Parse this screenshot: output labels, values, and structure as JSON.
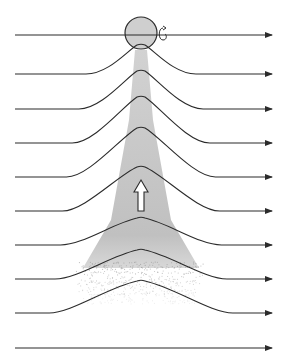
{
  "diagram": {
    "type": "streamline-flow-around-rotating-sphere",
    "colors": {
      "background": "#ffffff",
      "line": "#2b2b2b",
      "wake_fill": "#c4c4c4",
      "wake_speckle": "#9a9a9a",
      "sphere_fill": "#cfcfcf",
      "arrow_fill": "#ffffff"
    },
    "sphere": {
      "cx": 141,
      "cy": 33,
      "r": 16
    },
    "rotation_icon": {
      "x": 162,
      "y": 34
    },
    "streamlines": [
      {
        "baseline_y": 35,
        "peak_y": 35,
        "label": "streamline-0"
      },
      {
        "baseline_y": 74,
        "peak_y": 45,
        "label": "streamline-1"
      },
      {
        "baseline_y": 109,
        "peak_y": 71,
        "label": "streamline-2"
      },
      {
        "baseline_y": 143,
        "peak_y": 97,
        "label": "streamline-3"
      },
      {
        "baseline_y": 177,
        "peak_y": 128,
        "label": "streamline-4"
      },
      {
        "baseline_y": 211,
        "peak_y": 167,
        "label": "streamline-5"
      },
      {
        "baseline_y": 245,
        "peak_y": 218,
        "label": "streamline-6"
      },
      {
        "baseline_y": 279,
        "peak_y": 250,
        "label": "streamline-7"
      },
      {
        "baseline_y": 313,
        "peak_y": 281,
        "label": "streamline-8"
      },
      {
        "baseline_y": 348,
        "peak_y": 348,
        "label": "streamline-9"
      }
    ],
    "x_start": 15,
    "x_end": 272,
    "center_x": 141,
    "upward_arrow": {
      "x": 141,
      "y_top": 180,
      "y_bottom": 211
    }
  }
}
